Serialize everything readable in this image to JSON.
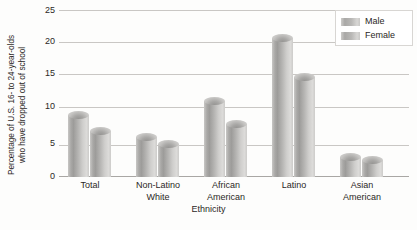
{
  "chart_data": {
    "type": "bar",
    "title": "",
    "xlabel": "Ethnicity",
    "ylabel": "Percentage of U.S. 16- to 24-year-olds who have dropped out of school",
    "ylabel_lines": [
      "Percentage of U.S. 16- to 24-year-olds",
      "who have dropped out of school"
    ],
    "categories": [
      "Total",
      "Non-Latino White",
      "African American",
      "Latino",
      "Asian American"
    ],
    "category_lines": [
      [
        "Total"
      ],
      [
        "Non-Latino",
        "White"
      ],
      [
        "African",
        "American"
      ],
      [
        "Latino"
      ],
      [
        "Asian",
        "American"
      ]
    ],
    "series": [
      {
        "name": "Male",
        "values": [
          9.3,
          6.0,
          11.5,
          21.0,
          3.0
        ]
      },
      {
        "name": "Female",
        "values": [
          7.0,
          5.0,
          8.0,
          15.0,
          2.5
        ]
      }
    ],
    "ylim": [
      0,
      25
    ],
    "ytick_values": [
      0,
      5,
      10,
      15,
      20,
      25
    ],
    "ytick_labels": [
      "0",
      "5",
      "10",
      "15",
      "20",
      "25"
    ],
    "grid": true,
    "legend_position": "top-right",
    "bar_style": "3d-cylinder",
    "colors": {
      "bar_light": "#dcdbd9",
      "bar_mid": "#b5b4b2",
      "bar_dark": "#9d9c9a",
      "gridline": "#c9c7c4",
      "axis": "#a9a7a4",
      "text": "#2b2725",
      "background": "#fdfdfc"
    }
  },
  "legend": {
    "entries": [
      {
        "label": "Male"
      },
      {
        "label": "Female"
      }
    ]
  }
}
